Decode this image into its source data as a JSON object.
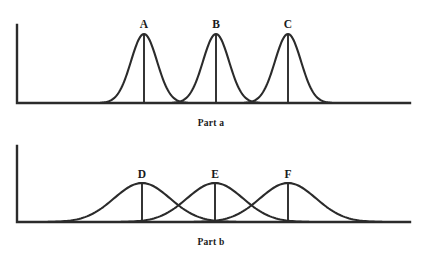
{
  "figure": {
    "background_color": "#ffffff",
    "ink_color": "#2b2b2b",
    "width": 422,
    "height": 262
  },
  "parts": [
    {
      "caption": "Part a",
      "axis": {
        "x_start": 17,
        "x_end": 410,
        "baseline_y": 103,
        "y_top": 25
      },
      "curves": [
        {
          "label": "A",
          "center": 144,
          "sigma": 13,
          "peak_y": 34,
          "label_y": 22
        },
        {
          "label": "B",
          "center": 216,
          "sigma": 13,
          "peak_y": 34,
          "label_y": 22
        },
        {
          "label": "C",
          "center": 288,
          "sigma": 13,
          "peak_y": 34,
          "label_y": 22
        }
      ]
    },
    {
      "caption": "Part b",
      "axis": {
        "x_start": 17,
        "x_end": 410,
        "baseline_y": 222,
        "y_top": 146
      },
      "curves": [
        {
          "label": "D",
          "center": 142,
          "sigma": 28,
          "peak_y": 183,
          "label_y": 172
        },
        {
          "label": "E",
          "center": 215,
          "sigma": 28,
          "peak_y": 183,
          "label_y": 172
        },
        {
          "label": "F",
          "center": 288,
          "sigma": 28,
          "peak_y": 183,
          "label_y": 172
        }
      ]
    }
  ],
  "chart_data": {
    "type": "line",
    "title": "",
    "xlabel": "",
    "ylabel": "",
    "grid": false,
    "legend": "none",
    "panels": [
      {
        "name": "Part a",
        "spread": "narrow",
        "overlap": false,
        "series": [
          {
            "name": "A",
            "mean": 144,
            "sigma": 13,
            "peak_height": 69
          },
          {
            "name": "B",
            "mean": 216,
            "sigma": 13,
            "peak_height": 69
          },
          {
            "name": "C",
            "mean": 288,
            "sigma": 13,
            "peak_height": 69
          }
        ]
      },
      {
        "name": "Part b",
        "spread": "wide",
        "overlap": true,
        "series": [
          {
            "name": "D",
            "mean": 142,
            "sigma": 28,
            "peak_height": 39
          },
          {
            "name": "E",
            "mean": 215,
            "sigma": 28,
            "peak_height": 39
          },
          {
            "name": "F",
            "mean": 288,
            "sigma": 28,
            "peak_height": 39
          }
        ]
      }
    ]
  }
}
